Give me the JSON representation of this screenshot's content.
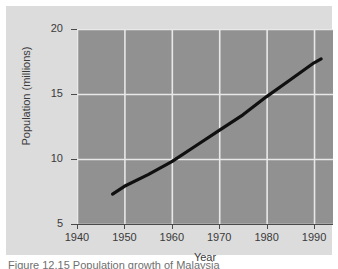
{
  "figure": {
    "caption": "Figure 12.15   Population growth of Malaysia",
    "panel_color": "#dcdcdc",
    "plot_background_color": "#919191",
    "grid_color": "#e8e8e8",
    "line_color": "#101010"
  },
  "chart_data": {
    "type": "line",
    "title": "",
    "xlabel": "Year",
    "ylabel": "Population (millions)",
    "xlim": [
      1940,
      1994
    ],
    "ylim": [
      5,
      20
    ],
    "xticks": [
      1940,
      1950,
      1960,
      1970,
      1980,
      1990
    ],
    "yticks": [
      5,
      10,
      15,
      20
    ],
    "xtick_labels": [
      "1940",
      "1950",
      "1960",
      "1970",
      "1980",
      "1990"
    ],
    "ytick_labels": [
      "5",
      "10",
      "15",
      "20"
    ],
    "grid": true,
    "legend": false,
    "series": [
      {
        "name": "Population",
        "x": [
          1947.5,
          1950,
          1955,
          1960,
          1965,
          1970,
          1975,
          1980,
          1985,
          1990,
          1991.5
        ],
        "values": [
          7.3,
          7.9,
          8.8,
          9.8,
          11.0,
          12.2,
          13.4,
          14.8,
          16.1,
          17.4,
          17.7
        ]
      }
    ]
  }
}
